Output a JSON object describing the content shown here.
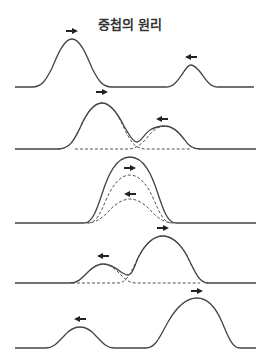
{
  "title": "중첩의 원리",
  "colors": {
    "line": "#444444",
    "dashed": "#555555",
    "arrow": "#222222",
    "background": "#ffffff"
  },
  "panels": [
    {
      "id": 1,
      "description": "Two separate pulses approaching each other",
      "baseline_y": 87,
      "pulses": [
        {
          "peak_x": 72,
          "peak_y": 39,
          "direction": "right"
        },
        {
          "peak_x": 191,
          "peak_y": 65,
          "direction": "left"
        }
      ]
    },
    {
      "id": 2,
      "description": "Pulses begin to overlap",
      "baseline_y": 149,
      "pulses": [
        {
          "peak_x": 102,
          "peak_y": 103,
          "direction": "right"
        },
        {
          "peak_x": 165,
          "peak_y": 126,
          "direction": "left"
        }
      ]
    },
    {
      "id": 3,
      "description": "Pulses fully overlap; resultant is sum",
      "baseline_y": 223,
      "pulses": [
        {
          "peak_x": 130,
          "peak_y": 175,
          "direction": "right"
        },
        {
          "peak_x": 130,
          "peak_y": 199,
          "direction": "left"
        }
      ],
      "resultant_peak_y": 157
    },
    {
      "id": 4,
      "description": "Pulses separating after passing through",
      "baseline_y": 283,
      "pulses": [
        {
          "peak_x": 103,
          "peak_y": 264,
          "direction": "left"
        },
        {
          "peak_x": 163,
          "peak_y": 236,
          "direction": "right"
        }
      ]
    },
    {
      "id": 5,
      "description": "Pulses separated, moving apart unchanged",
      "baseline_y": 348,
      "pulses": [
        {
          "peak_x": 80,
          "peak_y": 327,
          "direction": "left"
        },
        {
          "peak_x": 197,
          "peak_y": 298,
          "direction": "right"
        }
      ]
    }
  ]
}
